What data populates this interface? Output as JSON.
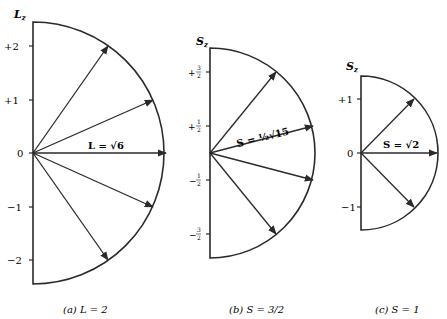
{
  "stroke_color": "#2a2a2a",
  "background_color": "#ffffff",
  "panels": [
    {
      "id": "a",
      "axis_label": "L",
      "axis_label_sub": "z",
      "vector_label": "L = √6",
      "caption": "(a)  L = 2",
      "quantum_number": 2,
      "magnitude": "√6",
      "ticks": [
        "+2",
        "+1",
        "0",
        "−1",
        "−2"
      ],
      "tick_values": [
        2,
        1,
        0,
        -1,
        -2
      ],
      "origin": [
        33,
        153
      ],
      "unit_px": 53.5,
      "radius_px": 131
    },
    {
      "id": "b",
      "axis_label": "S",
      "axis_label_sub": "z",
      "vector_label": "S = ½√15",
      "caption": "(b)  S = 3/2",
      "quantum_number": "3/2",
      "magnitude": "½√15",
      "ticks": [
        "+3/2",
        "+1/2",
        "−1/2",
        "−3/2"
      ],
      "tick_values": [
        1.5,
        0.5,
        -0.5,
        -1.5
      ],
      "origin": [
        210,
        153
      ],
      "unit_px": 54,
      "radius_px": 105
    },
    {
      "id": "c",
      "axis_label": "S",
      "axis_label_sub": "z",
      "vector_label": "S = √2",
      "caption": "(c)  S = 1",
      "quantum_number": 1,
      "magnitude": "√2",
      "ticks": [
        "+1",
        "0",
        "−1"
      ],
      "tick_values": [
        1,
        0,
        -1
      ],
      "origin": [
        361,
        153
      ],
      "unit_px": 54,
      "radius_px": 77
    }
  ]
}
